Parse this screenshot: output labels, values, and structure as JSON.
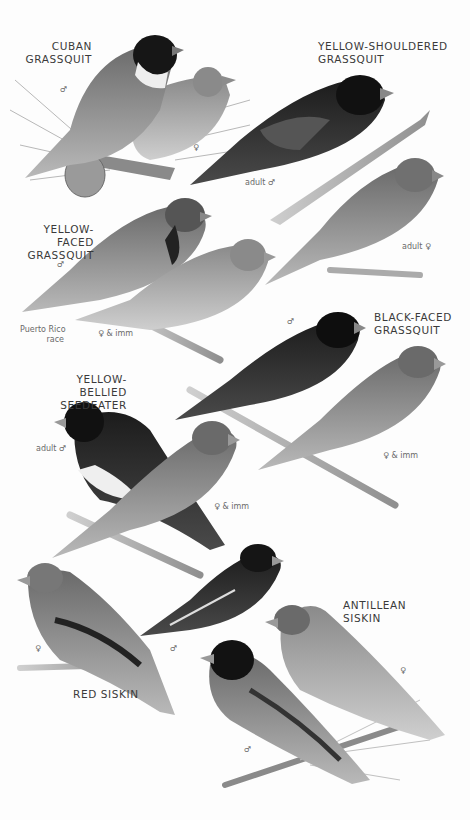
{
  "plate": {
    "background": "#fdfdfd",
    "species": [
      {
        "name_line1": "CUBAN",
        "name_line2": "GRASSQUIT",
        "notes": [
          "♂",
          "♀"
        ]
      },
      {
        "name_line1": "YELLOW-SHOULDERED",
        "name_line2": "GRASSQUIT",
        "notes": [
          "adult ♂",
          "adult ♀"
        ]
      },
      {
        "name_line1": "YELLOW-FACED",
        "name_line2": "GRASSQUIT",
        "notes": [
          "♂",
          "Puerto Rico",
          "race",
          "♀ & imm"
        ]
      },
      {
        "name_line1": "BLACK-FACED",
        "name_line2": "GRASSQUIT",
        "notes": [
          "♂",
          "♀ & imm"
        ]
      },
      {
        "name_line1": "YELLOW-BELLIED",
        "name_line2": "SEEDEATER",
        "notes": [
          "adult ♂",
          "♀ & imm"
        ]
      },
      {
        "name_line1": "ANTILLEAN",
        "name_line2": "SISKIN",
        "notes": [
          "♀",
          "♂"
        ]
      },
      {
        "name_line1": "RED SISKIN",
        "name_line2": "",
        "notes": [
          "♀",
          "♂"
        ]
      }
    ]
  }
}
